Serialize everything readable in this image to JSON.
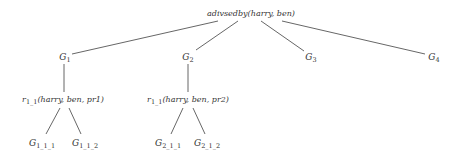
{
  "diagram": {
    "type": "tree",
    "root": {
      "id": "root",
      "label": "adivsedby(harry, ben)",
      "x": 251,
      "y": 14
    },
    "nodes": [
      {
        "id": "g1",
        "base": "G",
        "sub": "1",
        "x": 65,
        "y": 57
      },
      {
        "id": "g2",
        "base": "G",
        "sub": "2",
        "x": 188,
        "y": 57
      },
      {
        "id": "g3",
        "base": "G",
        "sub": "3",
        "x": 311,
        "y": 57
      },
      {
        "id": "g4",
        "base": "G",
        "sub": "4",
        "x": 434,
        "y": 57
      },
      {
        "id": "r1",
        "base": "r",
        "sub": "1_1",
        "args": "(harry, ben, pr1)",
        "x": 63,
        "y": 100
      },
      {
        "id": "r2",
        "base": "r",
        "sub": "1_1",
        "args": "(harry, ben, pr2)",
        "x": 188,
        "y": 100
      },
      {
        "id": "g111",
        "base": "G",
        "sub": "1_1_1",
        "x": 42,
        "y": 143
      },
      {
        "id": "g112",
        "base": "G",
        "sub": "1_1_2",
        "x": 85,
        "y": 143
      },
      {
        "id": "g211",
        "base": "G",
        "sub": "2_1_1",
        "x": 168,
        "y": 143
      },
      {
        "id": "g212",
        "base": "G",
        "sub": "2_1_2",
        "x": 207,
        "y": 143
      }
    ],
    "edges": [
      {
        "from": "root",
        "to": "g1",
        "x1": 218,
        "y1": 21,
        "x2": 72,
        "y2": 54
      },
      {
        "from": "root",
        "to": "g2",
        "x1": 238,
        "y1": 21,
        "x2": 196,
        "y2": 50
      },
      {
        "from": "root",
        "to": "g3",
        "x1": 261,
        "y1": 21,
        "x2": 304,
        "y2": 51
      },
      {
        "from": "root",
        "to": "g4",
        "x1": 282,
        "y1": 21,
        "x2": 425,
        "y2": 54
      },
      {
        "from": "g1",
        "to": "r1",
        "x1": 64,
        "y1": 64,
        "x2": 64,
        "y2": 92
      },
      {
        "from": "g2",
        "to": "r2",
        "x1": 188,
        "y1": 64,
        "x2": 188,
        "y2": 92
      },
      {
        "from": "r1",
        "to": "g111",
        "x1": 60,
        "y1": 108,
        "x2": 46,
        "y2": 134
      },
      {
        "from": "r1",
        "to": "g112",
        "x1": 69,
        "y1": 108,
        "x2": 81,
        "y2": 134
      },
      {
        "from": "r2",
        "to": "g211",
        "x1": 183,
        "y1": 108,
        "x2": 171,
        "y2": 134
      },
      {
        "from": "r2",
        "to": "g212",
        "x1": 193,
        "y1": 108,
        "x2": 205,
        "y2": 134
      }
    ]
  }
}
